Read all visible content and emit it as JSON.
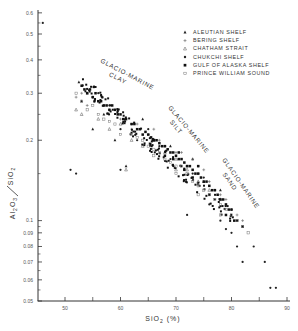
{
  "chart_data": {
    "type": "scatter",
    "title": "",
    "xlabel": "SiO2 (%)",
    "ylabel": "Al2O3 / SiO2",
    "xlim": [
      45,
      90
    ],
    "ylim": [
      0.05,
      0.6
    ],
    "yscale": "log",
    "grid": false,
    "legend_position": "upper right",
    "x_ticks": [
      50,
      60,
      70,
      80,
      90
    ],
    "x_minor_ticks": [
      55,
      65,
      75,
      85
    ],
    "y_ticks": [
      0.05,
      0.06,
      0.07,
      0.08,
      0.09,
      0.1,
      0.2,
      0.3,
      0.4,
      0.5,
      0.6
    ],
    "y_tick_labels": [
      "0.05",
      "0.06",
      "0.07",
      "0.08",
      "0.09",
      "0.1",
      "0.2",
      "0.3",
      "0.4",
      "0.5",
      "0.6"
    ],
    "annotations": [
      {
        "text": [
          "GLACIO-MARINE",
          "CLAY"
        ],
        "x": 57,
        "y": 0.36,
        "rotation": 28
      },
      {
        "text": [
          "GLACIO-MARINE",
          "SILT"
        ],
        "x": 70,
        "y": 0.24,
        "rotation": 52
      },
      {
        "text": [
          "GLACIO-MARINE",
          "SAND"
        ],
        "x": 80,
        "y": 0.14,
        "rotation": 55
      }
    ],
    "series": [
      {
        "name": "ALEUTIAN SHELF",
        "marker": "triangle-filled",
        "points": [
          [
            52.5,
            0.33
          ],
          [
            54,
            0.3
          ],
          [
            55,
            0.22
          ],
          [
            57,
            0.25
          ],
          [
            61,
            0.16
          ],
          [
            64,
            0.24
          ],
          [
            66,
            0.2
          ],
          [
            69,
            0.19
          ],
          [
            73,
            0.17
          ],
          [
            75,
            0.14
          ],
          [
            78,
            0.13
          ],
          [
            53,
            0.28
          ],
          [
            59,
            0.2
          ]
        ]
      },
      {
        "name": "BERING SHELF",
        "marker": "plus",
        "points": [
          [
            52,
            0.29
          ],
          [
            53,
            0.3
          ],
          [
            54,
            0.27
          ],
          [
            55,
            0.29
          ],
          [
            57,
            0.27
          ],
          [
            58,
            0.26
          ],
          [
            60,
            0.24
          ],
          [
            62,
            0.22
          ],
          [
            63,
            0.23
          ],
          [
            65,
            0.21
          ],
          [
            66,
            0.22
          ],
          [
            68,
            0.19
          ],
          [
            70,
            0.18
          ],
          [
            71,
            0.18
          ],
          [
            72,
            0.16
          ],
          [
            74,
            0.15
          ],
          [
            76,
            0.14
          ],
          [
            77,
            0.13
          ],
          [
            78,
            0.125
          ],
          [
            79,
            0.12
          ],
          [
            80,
            0.11
          ],
          [
            81,
            0.105
          ],
          [
            82,
            0.1
          ],
          [
            67,
            0.2
          ],
          [
            73,
            0.17
          ],
          [
            75,
            0.155
          ]
        ]
      },
      {
        "name": "CHATHAM STRAIT",
        "marker": "triangle-open",
        "points": [
          [
            52,
            0.26
          ],
          [
            53,
            0.25
          ],
          [
            56,
            0.24
          ],
          [
            58,
            0.22
          ],
          [
            60,
            0.23
          ],
          [
            62,
            0.2
          ],
          [
            64,
            0.19
          ],
          [
            66,
            0.2
          ],
          [
            68,
            0.18
          ],
          [
            70,
            0.17
          ],
          [
            72,
            0.155
          ],
          [
            74,
            0.14
          ],
          [
            76,
            0.13
          ],
          [
            78,
            0.12
          ],
          [
            61,
            0.155
          ],
          [
            70,
            0.155
          ]
        ]
      },
      {
        "name": "CHUKCHI SHELF",
        "marker": "dot",
        "points": [
          [
            46,
            0.55
          ],
          [
            51,
            0.155
          ],
          [
            52,
            0.15
          ],
          [
            55,
            0.29
          ],
          [
            56,
            0.3
          ],
          [
            58,
            0.27
          ],
          [
            59,
            0.26
          ],
          [
            60,
            0.22
          ],
          [
            62,
            0.23
          ],
          [
            63,
            0.2
          ],
          [
            65,
            0.22
          ],
          [
            67,
            0.19
          ],
          [
            69,
            0.17
          ],
          [
            71,
            0.16
          ],
          [
            73,
            0.15
          ],
          [
            74,
            0.16
          ],
          [
            75,
            0.145
          ],
          [
            77,
            0.12
          ],
          [
            78,
            0.1
          ],
          [
            79,
            0.093
          ],
          [
            80,
            0.09
          ],
          [
            81,
            0.08
          ],
          [
            82,
            0.07
          ],
          [
            84,
            0.08
          ],
          [
            86,
            0.07
          ],
          [
            87,
            0.056
          ],
          [
            88,
            0.056
          ],
          [
            76,
            0.115
          ],
          [
            72,
            0.105
          ],
          [
            60,
            0.155
          ]
        ]
      },
      {
        "name": "GULF OF ALASKA SHELF",
        "marker": "square-filled",
        "points": [
          [
            53,
            0.32
          ],
          [
            53.5,
            0.31
          ],
          [
            54,
            0.3
          ],
          [
            54.5,
            0.31
          ],
          [
            55,
            0.29
          ],
          [
            55.5,
            0.3
          ],
          [
            56,
            0.28
          ],
          [
            56.5,
            0.28
          ],
          [
            57,
            0.27
          ],
          [
            57.5,
            0.27
          ],
          [
            58,
            0.26
          ],
          [
            58.5,
            0.27
          ],
          [
            59,
            0.26
          ],
          [
            59.5,
            0.25
          ],
          [
            60,
            0.25
          ],
          [
            60.5,
            0.24
          ],
          [
            61,
            0.24
          ],
          [
            62,
            0.23
          ],
          [
            62.5,
            0.23
          ],
          [
            63,
            0.22
          ],
          [
            63.5,
            0.22
          ],
          [
            64,
            0.21
          ],
          [
            64.5,
            0.215
          ],
          [
            65,
            0.21
          ],
          [
            65.5,
            0.205
          ],
          [
            66,
            0.2
          ],
          [
            66.5,
            0.2
          ],
          [
            67,
            0.195
          ],
          [
            67.5,
            0.19
          ],
          [
            68,
            0.19
          ],
          [
            68.5,
            0.185
          ],
          [
            69,
            0.18
          ],
          [
            69.5,
            0.18
          ],
          [
            70,
            0.175
          ],
          [
            70.5,
            0.17
          ],
          [
            71,
            0.17
          ],
          [
            71.5,
            0.165
          ],
          [
            72,
            0.16
          ],
          [
            72.5,
            0.16
          ],
          [
            73,
            0.155
          ],
          [
            73.5,
            0.15
          ],
          [
            74,
            0.15
          ],
          [
            74.5,
            0.145
          ],
          [
            75,
            0.14
          ],
          [
            75.5,
            0.14
          ],
          [
            76,
            0.135
          ],
          [
            76.5,
            0.13
          ],
          [
            77,
            0.13
          ],
          [
            77.5,
            0.125
          ],
          [
            78,
            0.12
          ],
          [
            78.5,
            0.12
          ],
          [
            79,
            0.115
          ],
          [
            79.5,
            0.11
          ],
          [
            80,
            0.11
          ],
          [
            81,
            0.1
          ],
          [
            82,
            0.095
          ],
          [
            69.5,
            0.17
          ],
          [
            70.5,
            0.18
          ],
          [
            68,
            0.175
          ],
          [
            71.5,
            0.155
          ],
          [
            73,
            0.145
          ],
          [
            74,
            0.16
          ],
          [
            76,
            0.125
          ],
          [
            79,
            0.105
          ],
          [
            80.5,
            0.1
          ]
        ]
      },
      {
        "name": "PRINCE WILLIAM SOUND",
        "marker": "square-open",
        "points": [
          [
            52,
            0.3
          ],
          [
            53,
            0.28
          ],
          [
            54,
            0.26
          ],
          [
            55,
            0.27
          ],
          [
            56,
            0.25
          ],
          [
            57,
            0.24
          ],
          [
            58,
            0.235
          ],
          [
            59,
            0.23
          ],
          [
            60,
            0.21
          ],
          [
            62,
            0.21
          ],
          [
            63,
            0.205
          ],
          [
            64,
            0.2
          ],
          [
            65,
            0.19
          ],
          [
            66,
            0.185
          ],
          [
            67,
            0.18
          ],
          [
            68,
            0.17
          ],
          [
            69,
            0.165
          ],
          [
            70,
            0.16
          ],
          [
            71,
            0.16
          ],
          [
            72,
            0.15
          ],
          [
            73,
            0.14
          ],
          [
            74,
            0.135
          ],
          [
            75,
            0.13
          ],
          [
            76,
            0.125
          ],
          [
            77,
            0.12
          ],
          [
            78,
            0.115
          ],
          [
            79,
            0.11
          ],
          [
            80,
            0.105
          ],
          [
            81,
            0.1
          ],
          [
            82,
            0.095
          ],
          [
            83,
            0.09
          ],
          [
            66,
            0.175
          ],
          [
            70,
            0.15
          ],
          [
            74,
            0.125
          ],
          [
            78,
            0.105
          ]
        ]
      }
    ]
  },
  "legend": {
    "items": [
      {
        "label": "ALEUTIAN SHELF",
        "marker": "triangle-filled"
      },
      {
        "label": "BERING SHELF",
        "marker": "plus"
      },
      {
        "label": "CHATHAM STRAIT",
        "marker": "triangle-open"
      },
      {
        "label": "CHUKCHI SHELF",
        "marker": "dot"
      },
      {
        "label": "GULF OF ALASKA SHELF",
        "marker": "square-filled"
      },
      {
        "label": "PRINCE WILLIAM SOUND",
        "marker": "square-open"
      }
    ]
  },
  "axes": {
    "x_title": "SiO",
    "x_title_sub": "2",
    "x_title_suffix": "(%)",
    "y_title_num": "Al",
    "y_title_num_sub1": "2",
    "y_title_num_mid": "O",
    "y_title_num_sub2": "3",
    "y_title_den": "SiO",
    "y_title_den_sub": "2"
  },
  "regions": {
    "clay_line1": "GLACIO-MARINE",
    "clay_line2": "CLAY",
    "silt_line1": "GLACIO-MARINE",
    "silt_line2": "SILT",
    "sand_line1": "GLACIO-MARINE",
    "sand_line2": "SAND"
  }
}
